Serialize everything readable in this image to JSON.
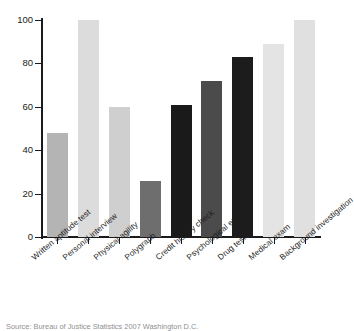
{
  "chart_data": {
    "type": "bar",
    "title": "",
    "subtitle": "",
    "xlabel": "",
    "ylabel": "",
    "ylim": [
      0,
      100
    ],
    "yticks": [
      0,
      20,
      40,
      60,
      80,
      100
    ],
    "grid": false,
    "legend": "none",
    "categories": [
      "Written aptitude test",
      "Personal interview",
      "Physical agility",
      "Polygraph",
      "Credit history check",
      "Psychological exam",
      "Drug test",
      "Medical exam",
      "Background investigation"
    ],
    "values": [
      48,
      100,
      60,
      26,
      61,
      72,
      83,
      89,
      100
    ],
    "bar_colors": [
      "#b4b4b4",
      "#dcdcdc",
      "#cfcfcf",
      "#6e6e6e",
      "#1a1a1a",
      "#4b4b4b",
      "#1c1c1c",
      "#e4e4e4",
      "#e0e0e0"
    ]
  },
  "axis": {
    "y_tick_labels": [
      "0",
      "20",
      "40",
      "60",
      "80",
      "100"
    ]
  },
  "caption": {
    "source_text": "Source: Bureau of Justice Statistics 2007 Washington D.C."
  }
}
